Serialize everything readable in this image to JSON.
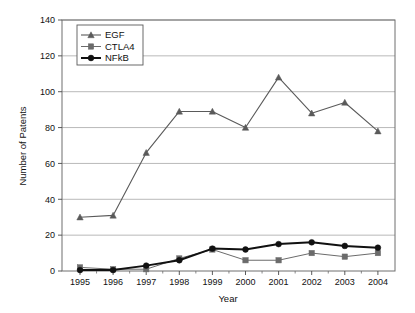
{
  "chart_data": {
    "type": "line",
    "title": "",
    "xlabel": "Year",
    "ylabel": "Number of Patents",
    "categories": [
      "1995",
      "1996",
      "1997",
      "1998",
      "1999",
      "2000",
      "2001",
      "2002",
      "2003",
      "2004"
    ],
    "x": [
      1995,
      1996,
      1997,
      1998,
      1999,
      2000,
      2001,
      2002,
      2003,
      2004
    ],
    "series": [
      {
        "name": "EGF",
        "marker": "triangle",
        "color": "#5a5a5a",
        "line_width": 1.1,
        "values": [
          30,
          31,
          66,
          89,
          89,
          80,
          108,
          88,
          94,
          78
        ]
      },
      {
        "name": "CTLA4",
        "marker": "square",
        "color": "#6b6b6b",
        "line_width": 1.0,
        "values": [
          2,
          1,
          1,
          7,
          12,
          6,
          6,
          10,
          8,
          10
        ]
      },
      {
        "name": "NFkB",
        "marker": "circle",
        "color": "#111111",
        "line_width": 2.0,
        "values": [
          0.5,
          0.5,
          3,
          6,
          12.5,
          12,
          15,
          16,
          14,
          13
        ]
      }
    ],
    "ylim": [
      0,
      140
    ],
    "yticks": [
      0,
      20,
      40,
      60,
      80,
      100,
      120,
      140
    ],
    "ytick_labels": [
      "0",
      "20",
      "40",
      "60",
      "80",
      "100",
      "120",
      "140"
    ],
    "xtick_labels": [
      "1995",
      "1996",
      "1997",
      "1998",
      "1999",
      "2000",
      "2001",
      "2002",
      "2003",
      "2004"
    ],
    "grid": true,
    "grid_axis": "y",
    "legend_position": "top-left",
    "legend_entries": [
      "EGF",
      "CTLA4",
      "NFkB"
    ],
    "background": "#ffffff",
    "frame_color": "#6e6e6e",
    "grid_color": "#9a9a9a"
  },
  "layout": {
    "plot_left": 62,
    "plot_right": 395,
    "plot_top": 20,
    "plot_bottom": 271,
    "first_x": 80,
    "x_step": 33.1
  }
}
